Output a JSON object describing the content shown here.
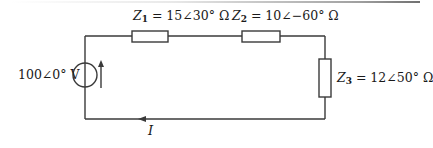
{
  "diagram": {
    "type": "series AC circuit",
    "source": {
      "label": "100∠0° V",
      "magnitude": 100,
      "angle_deg": 0,
      "unit": "V",
      "arrow_direction": "up"
    },
    "impedances": [
      {
        "name": "Z",
        "subscript": "1",
        "value_text": " = 15∠30° Ω",
        "magnitude": 15,
        "angle_deg": 30,
        "unit": "Ω",
        "position": "top-left"
      },
      {
        "name": "Z",
        "subscript": "2",
        "value_text": " = 10∠−60° Ω",
        "magnitude": 10,
        "angle_deg": -60,
        "unit": "Ω",
        "position": "top-right"
      },
      {
        "name": "Z",
        "subscript": "3",
        "value_text": " = 12∠50° Ω",
        "magnitude": 12,
        "angle_deg": 50,
        "unit": "Ω",
        "position": "right"
      }
    ],
    "current": {
      "label": "I",
      "arrow_direction": "left",
      "position": "bottom wire"
    }
  },
  "colors": {
    "line": "#3a3a3a",
    "text": "#1a1a1a",
    "background": "#ffffff"
  }
}
